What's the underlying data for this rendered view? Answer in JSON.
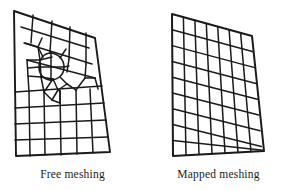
{
  "figure": {
    "type": "finite-element-mesh-comparison",
    "background_color": "#ffffff",
    "line_color": "#1a1a1a",
    "panels": [
      {
        "id": "free",
        "caption": "Free meshing",
        "mesh_type": "unstructured quadrilateral",
        "description": "Irregular quad mesh with local refinement around an interior circular feature, graded transition to coarse quads"
      },
      {
        "id": "mapped",
        "caption": "Mapped meshing",
        "mesh_type": "structured quadrilateral",
        "columns": 7,
        "rows": 9,
        "description": "Regular mapped grid over a quadrilateral domain"
      }
    ]
  },
  "free_mesh": {
    "boundary": [
      [
        14,
        11
      ],
      [
        95,
        38
      ],
      [
        110,
        152
      ],
      [
        16,
        156
      ]
    ],
    "feature": {
      "type": "circle",
      "cx": 51,
      "cy": 66,
      "r": 13
    }
  },
  "mapped_mesh": {
    "boundary": [
      [
        172,
        14
      ],
      [
        252,
        36
      ],
      [
        264,
        151
      ],
      [
        173,
        156
      ]
    ],
    "columns": 7,
    "rows": 9
  },
  "captions": {
    "free": "Free meshing",
    "mapped": "Mapped meshing"
  }
}
